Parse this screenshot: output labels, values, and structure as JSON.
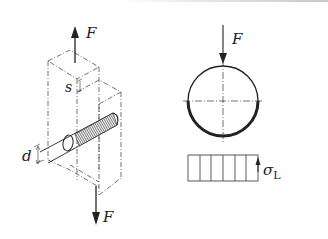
{
  "diagram": {
    "left_figure": {
      "description": "isometric view of pin joint loaded in double shear",
      "force_top": {
        "label": "F",
        "direction": "up"
      },
      "force_bottom": {
        "label": "F",
        "direction": "down"
      },
      "dimension_thickness": {
        "label": "s"
      },
      "dimension_diameter": {
        "label": "d"
      }
    },
    "right_figure": {
      "description": "cross-section of pin with bearing pressure",
      "force": {
        "label": "F",
        "direction": "down"
      },
      "stress_block": {
        "label": "σ",
        "subscript": "L",
        "columns": 6
      }
    }
  },
  "colors": {
    "line": "#222222",
    "background": "#ffffff"
  }
}
